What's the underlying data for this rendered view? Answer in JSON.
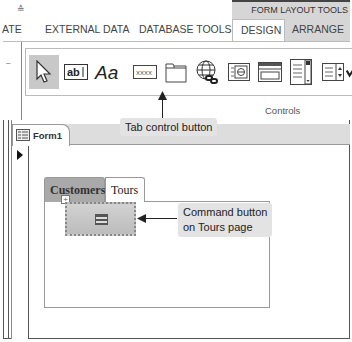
{
  "titlebar": {
    "qat_separator": "≙",
    "contextual_group": "FORM LAYOUT TOOLS"
  },
  "ribbon_tabs": [
    {
      "label": "ATE",
      "active": false
    },
    {
      "label": "EXTERNAL DATA",
      "active": false
    },
    {
      "label": "DATABASE TOOLS",
      "active": false
    },
    {
      "label": "DESIGN",
      "active": true
    },
    {
      "label": "ARRANGE",
      "active": false
    }
  ],
  "ribbon": {
    "group_label": "Controls",
    "controls": [
      {
        "name": "select",
        "icon": "pointer-arrow-icon",
        "selected": true
      },
      {
        "name": "text-box",
        "icon": "textbox-ab-icon",
        "glyph": "ab|"
      },
      {
        "name": "label",
        "icon": "label-aa-icon",
        "glyph": "Aa"
      },
      {
        "name": "button",
        "icon": "button-xxxx-icon",
        "glyph": "xxxx"
      },
      {
        "name": "tab-control",
        "icon": "tab-control-icon"
      },
      {
        "name": "hyperlink",
        "icon": "globe-link-icon"
      },
      {
        "name": "web-browser-control",
        "icon": "web-browser-icon"
      },
      {
        "name": "navigation-control",
        "icon": "navigation-control-icon"
      },
      {
        "name": "combo-box",
        "icon": "list-box-icon"
      },
      {
        "name": "list-box",
        "icon": "combo-box-icon"
      },
      {
        "name": "check-box",
        "icon": "check-mark-icon"
      }
    ]
  },
  "document": {
    "tab_label": "Form1",
    "tab_control": {
      "pages": [
        {
          "label": "Customers",
          "active": false
        },
        {
          "label": "Tours",
          "active": true
        }
      ]
    }
  },
  "callouts": {
    "tab_control_button": "Tab control button",
    "command_button_line1": "Command button",
    "command_button_line2": "on Tours page"
  },
  "colors": {
    "contextual_bg": "#d6d6d6",
    "callout_bg": "#e3e3e3",
    "inactive_page_tab": "#a9a9a9"
  }
}
